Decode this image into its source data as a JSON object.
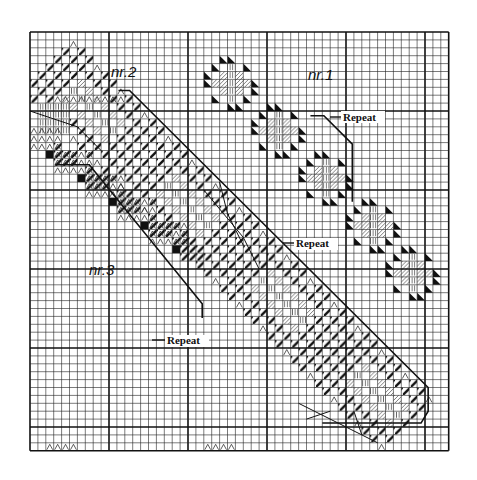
{
  "chart_data": {
    "type": "diagram",
    "title": "",
    "grid": {
      "x0": 30,
      "y0": 32,
      "cell": 7.9,
      "cols": 53,
      "rows": 53,
      "major_every": 10,
      "minor_color": "#222222",
      "major_color": "#111111"
    },
    "symbols": {
      "hatch": "diagonal-hatch (dark)",
      "light_hatch": "light diagonal hatch",
      "vertical": "vertical lines",
      "caret": "caret/peak (^)",
      "triangle": "solid half triangle",
      "block": "solid black block"
    }
  },
  "labels": {
    "nr1": "nr.1",
    "nr2": "nr.2",
    "nr3": "nr.3",
    "repeat1": "Repeat",
    "repeat2": "Repeat",
    "repeat3": "Repeat"
  },
  "patterns": {
    "nr1": {
      "motif_centers": [
        [
          25,
          6
        ],
        [
          31,
          12
        ],
        [
          37,
          18
        ],
        [
          43,
          24
        ],
        [
          48,
          30
        ]
      ],
      "repeat_bracket": [
        [
          10.8,
          7
        ],
        [
          36.2,
          7
        ],
        [
          38.2,
          9
        ],
        [
          38.2,
          12
        ],
        [
          35.5,
          12
        ]
      ]
    },
    "nr2": {
      "start": [
        2,
        2
      ],
      "end": [
        50,
        50
      ],
      "repeat_bracket": [
        [
          11,
          7
        ],
        [
          12.5,
          7
        ],
        [
          50,
          44.5
        ],
        [
          50,
          47
        ],
        [
          49,
          48.5
        ],
        [
          45,
          48.5
        ]
      ]
    },
    "nr3": {
      "motif_rows": [
        [
          2,
          14
        ],
        [
          6,
          17
        ],
        [
          10,
          20
        ],
        [
          14,
          23
        ],
        [
          18,
          26
        ]
      ],
      "repeat_bracket": [
        [
          3,
          16.5
        ],
        [
          7,
          16.5
        ],
        [
          21,
          31.5
        ],
        [
          21,
          33
        ]
      ]
    }
  }
}
